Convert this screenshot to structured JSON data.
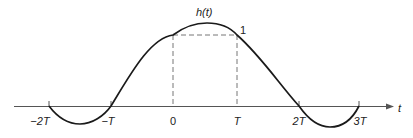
{
  "figure": {
    "function_label": "h(t)",
    "axis_label": "t",
    "peak_marker_label": "1",
    "ticks": [
      {
        "label": "−2T",
        "x": 49
      },
      {
        "label": "−T",
        "x": 111
      },
      {
        "label": "0",
        "x": 173
      },
      {
        "label": "T",
        "x": 237
      },
      {
        "label": "2T",
        "x": 299
      },
      {
        "label": "3T",
        "x": 359
      }
    ],
    "curve_description": "Raised-cosine-like pulse: zero crossings at -T and 2T, peak near T/2, negative lobes between -2T and -T and between 2T and 3T; dashed rectangle from 0 to T at height 1",
    "colors": {
      "curve": "#1a1a1a",
      "axis": "#555555",
      "dashed": "#777777"
    }
  }
}
